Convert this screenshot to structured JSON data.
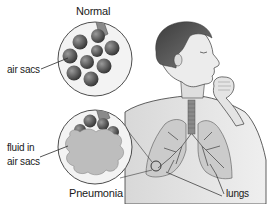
{
  "diagram": {
    "labels": {
      "normal": "Normal",
      "air_sacs": "air sacs",
      "fluid_line1": "fluid in",
      "fluid_line2": "air sacs",
      "pneumonia": "Pneumonia",
      "lungs": "lungs"
    },
    "colors": {
      "outline": "#3a3a3a",
      "skin": "#e8e8e8",
      "hair": "#5a5a5a",
      "lung_fill": "#c9c9c9",
      "bronchi": "#6e6e6e",
      "sac_dark": "#5c5c5c",
      "fluid": "#bdbdbd",
      "circle_bg": "#f2f2f2"
    }
  }
}
